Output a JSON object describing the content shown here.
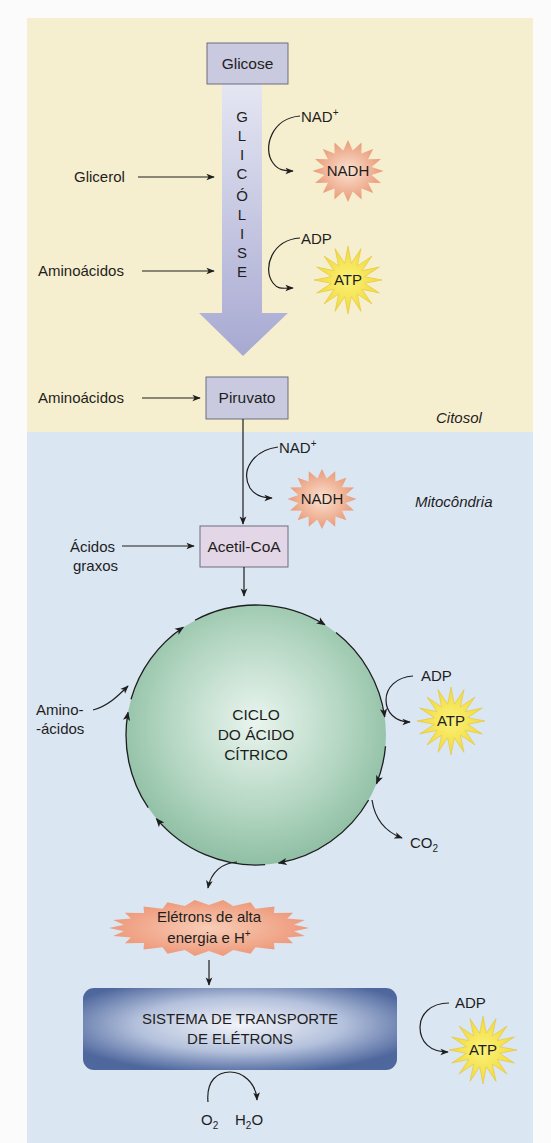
{
  "regions": {
    "cytosol": "Citosol",
    "mitochondria": "Mitocôndria"
  },
  "boxes": {
    "glucose": "Glicose",
    "pyruvate": "Piruvato",
    "acetyl_coa": "Acetil-CoA"
  },
  "glycolysis": {
    "letters": [
      "G",
      "L",
      "I",
      "C",
      "Ó",
      "L",
      "I",
      "S",
      "E"
    ]
  },
  "inputs": {
    "glycerol": "Glicerol",
    "amino_acids_1": "Aminoácidos",
    "amino_acids_2": "Aminoácidos",
    "fatty_acids_line1": "Ácidos",
    "fatty_acids_line2": "graxos",
    "amino_acids_cycle_line1": "Amino-",
    "amino_acids_cycle_line2": "-ácidos"
  },
  "cofactors": {
    "glycolysis_nad": "NAD",
    "glycolysis_nad_sup": "+",
    "glycolysis_nadh": "NADH",
    "glycolysis_adp": "ADP",
    "glycolysis_atp": "ATP",
    "pdh_nad": "NAD",
    "pdh_nad_sup": "+",
    "pdh_nadh": "NADH",
    "cycle_adp": "ADP",
    "cycle_atp": "ATP",
    "cycle_co2": "CO",
    "cycle_co2_sub": "2",
    "ets_adp": "ADP",
    "ets_atp": "ATP",
    "o2": "O",
    "o2_sub": "2",
    "h2o_h": "H",
    "h2o_sub": "2",
    "h2o_o": "O"
  },
  "cycle": {
    "line1": "CICLO",
    "line2": "DO ÁCIDO",
    "line3": "CÍTRICO"
  },
  "electrons": {
    "line1": "Elétrons de alta",
    "line2": "energia e H",
    "line2_sup": "+"
  },
  "ets": {
    "line1": "SISTEMA DE TRANSPORTE",
    "line2": "DE ELÉTRONS"
  },
  "colors": {
    "cytosol_bg": "#f6efcf",
    "mito_bg": "#dbe6f3",
    "box_fill": "#c9c9df",
    "acetyl_fill": "#e3d6e6",
    "arrow_fill": "#b9bad9",
    "nadh_fill": "#eea785",
    "atp_fill": "#f7e84a",
    "cycle_fill": "#a6cdb7",
    "electrons_fill": "#ef9f80",
    "ets_fill": "#5b73a6"
  }
}
